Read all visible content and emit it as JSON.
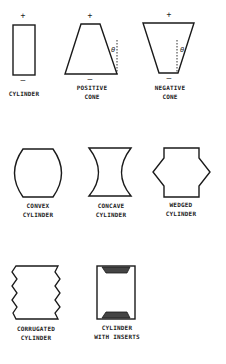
{
  "figure": {
    "colors": {
      "stroke": "#1a1a1a",
      "background": "#ffffff",
      "insert_fill": "#444444"
    },
    "shapes": [
      {
        "id": "cylinder",
        "label_lines": [
          "CYLINDER"
        ],
        "top_sign": "+",
        "bottom_sign": "—"
      },
      {
        "id": "positive-cone",
        "label_lines": [
          "POSITIVE",
          "CONE"
        ],
        "top_sign": "+",
        "bottom_sign": "—",
        "angle_symbol": "θ"
      },
      {
        "id": "negative-cone",
        "label_lines": [
          "NEGATIVE",
          "CONE"
        ],
        "top_sign": "+",
        "bottom_sign": "—",
        "angle_symbol": "θ"
      },
      {
        "id": "convex-cylinder",
        "label_lines": [
          "CONVEX",
          "CYLINDER"
        ]
      },
      {
        "id": "concave-cylinder",
        "label_lines": [
          "CONCAVE",
          "CYLINDER"
        ]
      },
      {
        "id": "wedged-cylinder",
        "label_lines": [
          "WEDGED",
          "CYLINDER"
        ]
      },
      {
        "id": "corrugated-cylinder",
        "label_lines": [
          "CORRUGATED",
          "CYLINDER"
        ]
      },
      {
        "id": "cylinder-with-inserts",
        "label_lines": [
          "CYLINDER",
          "WITH INSERTS"
        ]
      }
    ]
  }
}
